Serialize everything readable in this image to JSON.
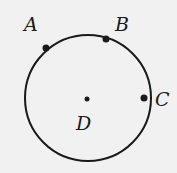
{
  "diagram": {
    "type": "circle-with-points",
    "background": "#f1f1f1",
    "stroke_color": "#1a1a1a",
    "circle": {
      "cx": 88,
      "cy": 98,
      "r": 63
    },
    "points": [
      {
        "id": "A",
        "label": "A",
        "x": 46,
        "y": 48,
        "label_x": 24,
        "label_y": 31,
        "on_circle": true
      },
      {
        "id": "B",
        "label": "B",
        "x": 106,
        "y": 39,
        "label_x": 115,
        "label_y": 31,
        "on_circle": true
      },
      {
        "id": "C",
        "label": "C",
        "x": 144,
        "y": 98,
        "label_x": 155,
        "label_y": 106,
        "on_circle": true
      },
      {
        "id": "D",
        "label": "D",
        "x": 87,
        "y": 99,
        "label_x": 76,
        "label_y": 130,
        "on_circle": false
      }
    ]
  }
}
